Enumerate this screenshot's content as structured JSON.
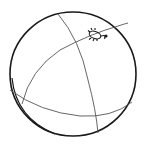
{
  "illustration": {
    "subject": "ball with seam lines and small bug",
    "colors": {
      "background": "#ffffff",
      "outline": "#1a1a1a",
      "seam": "#555555"
    },
    "elements": [
      {
        "name": "ball-outline-icon",
        "type": "circle"
      },
      {
        "name": "seam-lines",
        "type": "curves"
      },
      {
        "name": "bug-icon",
        "type": "insect"
      }
    ]
  }
}
